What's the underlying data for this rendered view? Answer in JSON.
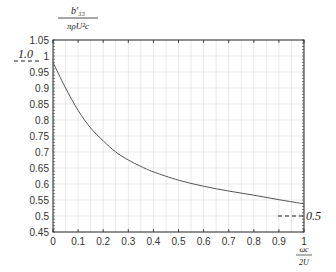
{
  "chart_data": {
    "type": "line",
    "title": "",
    "ylabel": "b'_33 / (π ρ U^2 c)",
    "xlabel": "ωc / 2U",
    "xlim": [
      0,
      1
    ],
    "ylim": [
      0.45,
      1.05
    ],
    "grid": true,
    "x_ticks": [
      "0",
      "0.1",
      "0.2",
      "0.3",
      "0.4",
      "0.5",
      "0.6",
      "0.7",
      "0.8",
      "0.9",
      "1"
    ],
    "y_ticks": [
      "0.45",
      "0.5",
      "0.55",
      "0.6",
      "0.65",
      "0.7",
      "0.75",
      "0.8",
      "0.85",
      "0.9",
      "0.95",
      "1",
      "1.05"
    ],
    "series": [
      {
        "name": "b'33 curve",
        "x": [
          0,
          0.05,
          0.1,
          0.15,
          0.2,
          0.25,
          0.3,
          0.35,
          0.4,
          0.5,
          0.6,
          0.7,
          0.8,
          0.9,
          1.0
        ],
        "values": [
          0.98,
          0.9,
          0.83,
          0.775,
          0.735,
          0.7,
          0.675,
          0.655,
          0.638,
          0.612,
          0.593,
          0.578,
          0.565,
          0.551,
          0.538
        ]
      }
    ],
    "annotations": [
      {
        "text": "1.0",
        "position": "left, at y=1.0 with dashed marker"
      },
      {
        "text": "0.5",
        "position": "right, at y=0.5 with dashed marker"
      }
    ]
  },
  "labels": {
    "y_num": "b′₃₃",
    "y_den": "πρU²c",
    "x_num": "ωc",
    "x_den": "2U",
    "left_annot": "1.0",
    "right_annot": "0.5"
  }
}
